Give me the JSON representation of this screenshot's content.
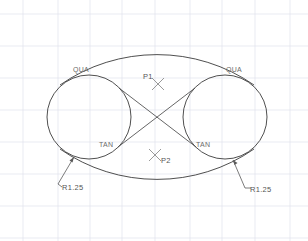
{
  "drawing": {
    "title": "Tangent Circles Construction",
    "background_color": "#ffffff",
    "grid_color": "#dfe3ec",
    "line_color": "#3b3b3b",
    "annotation_color": "#6b6b6b",
    "marker_color": "#8d8d8d"
  },
  "annotations": {
    "qua_left": "QUA",
    "qua_right": "QUA",
    "tan_left": "TAN",
    "tan_right": "TAN",
    "point_1": "P1",
    "point_2": "P2",
    "radius_left": "R1.25",
    "radius_right": "R1.25"
  },
  "geometry": {
    "circle_left": {
      "cx": 89,
      "cy": 117,
      "r": 42
    },
    "circle_right": {
      "cx": 225,
      "cy": 117,
      "r": 42
    },
    "crossing_point": {
      "x": 157,
      "y": 120
    },
    "top_arc_apex": {
      "x": 157,
      "y": 48
    },
    "bottom_arc_low": {
      "x": 157,
      "y": 186
    },
    "marker_p1": {
      "x": 158,
      "y": 84
    },
    "marker_p2": {
      "x": 155,
      "y": 155
    }
  },
  "grid": {
    "vertical_x": [
      23,
      58,
      90,
      122,
      155,
      190,
      222,
      255,
      290
    ],
    "horizontal_y": [
      14,
      46,
      78,
      110,
      142,
      174,
      206,
      238
    ]
  }
}
